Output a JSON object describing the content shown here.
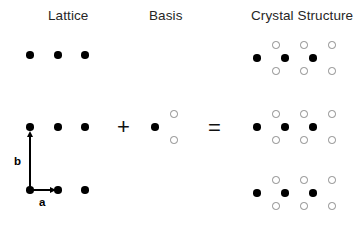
{
  "figure": {
    "width": 364,
    "height": 225,
    "background": "#ffffff",
    "equation": "Lattice + Basis = Crystal Structure"
  },
  "headings": [
    {
      "key": "lattice",
      "label": "Lattice",
      "x": 48,
      "y": 9
    },
    {
      "key": "basis",
      "label": "Basis",
      "x": 149,
      "y": 9
    },
    {
      "key": "crystal",
      "label": "Crystal Structure",
      "x": 251,
      "y": 9
    }
  ],
  "operators": [
    {
      "key": "plus",
      "symbol": "+",
      "x": 117,
      "y": 116
    },
    {
      "key": "equals",
      "symbol": "=",
      "x": 208,
      "y": 117
    }
  ],
  "colors": {
    "filled_atom": "#000000",
    "open_atom_fill": "#ffffff",
    "open_atom_stroke": "#8c8c8c",
    "text": "#262626",
    "vector": "#000000",
    "background": "#ffffff"
  },
  "atom_sizes": {
    "filled_diameter": 7.5,
    "open_diameter": 7.5
  },
  "lattice": {
    "name": "Lattice",
    "columns_x": [
      30,
      58,
      85
    ],
    "rows_y": [
      55,
      127,
      190
    ],
    "points": [
      {
        "x": 30,
        "y": 55
      },
      {
        "x": 58,
        "y": 55
      },
      {
        "x": 85,
        "y": 55
      },
      {
        "x": 30,
        "y": 127
      },
      {
        "x": 58,
        "y": 127
      },
      {
        "x": 85,
        "y": 127
      },
      {
        "x": 30,
        "y": 190
      },
      {
        "x": 58,
        "y": 190
      },
      {
        "x": 85,
        "y": 190
      }
    ],
    "vectors": [
      {
        "key": "b",
        "label": "b",
        "direction": "up",
        "origin": {
          "x": 30,
          "y": 189
        },
        "tip": {
          "x": 30,
          "y": 131
        },
        "label_pos": {
          "x": 14,
          "y": 155
        }
      },
      {
        "key": "a",
        "label": "a",
        "direction": "right",
        "origin": {
          "x": 32,
          "y": 190
        },
        "tip": {
          "x": 56,
          "y": 190
        },
        "label_pos": {
          "x": 39,
          "y": 196
        }
      }
    ]
  },
  "basis": {
    "name": "Basis",
    "atoms": [
      {
        "type": "filled",
        "x": 155,
        "y": 127
      },
      {
        "type": "open",
        "x": 174,
        "y": 114
      },
      {
        "type": "open",
        "x": 174,
        "y": 140
      }
    ]
  },
  "crystal": {
    "name": "Crystal Structure",
    "filled_columns_x": [
      257,
      285,
      313
    ],
    "open_columns_x": [
      276,
      304,
      332
    ],
    "group_centers_y": [
      58,
      127,
      193
    ],
    "open_offset_y": 13,
    "groups": [
      {
        "key": "group-top",
        "center_y": 58,
        "atoms": [
          {
            "type": "filled",
            "x": 257,
            "y": 58
          },
          {
            "type": "filled",
            "x": 285,
            "y": 58
          },
          {
            "type": "filled",
            "x": 313,
            "y": 58
          },
          {
            "type": "open",
            "x": 276,
            "y": 45
          },
          {
            "type": "open",
            "x": 304,
            "y": 45
          },
          {
            "type": "open",
            "x": 332,
            "y": 45
          },
          {
            "type": "open",
            "x": 276,
            "y": 71
          },
          {
            "type": "open",
            "x": 304,
            "y": 71
          },
          {
            "type": "open",
            "x": 332,
            "y": 71
          }
        ]
      },
      {
        "key": "group-middle",
        "center_y": 127,
        "atoms": [
          {
            "type": "filled",
            "x": 257,
            "y": 127
          },
          {
            "type": "filled",
            "x": 285,
            "y": 127
          },
          {
            "type": "filled",
            "x": 313,
            "y": 127
          },
          {
            "type": "open",
            "x": 276,
            "y": 114
          },
          {
            "type": "open",
            "x": 304,
            "y": 114
          },
          {
            "type": "open",
            "x": 332,
            "y": 114
          },
          {
            "type": "open",
            "x": 276,
            "y": 140
          },
          {
            "type": "open",
            "x": 304,
            "y": 140
          },
          {
            "type": "open",
            "x": 332,
            "y": 140
          }
        ]
      },
      {
        "key": "group-bottom",
        "center_y": 193,
        "atoms": [
          {
            "type": "filled",
            "x": 257,
            "y": 193
          },
          {
            "type": "filled",
            "x": 285,
            "y": 193
          },
          {
            "type": "filled",
            "x": 313,
            "y": 193
          },
          {
            "type": "open",
            "x": 276,
            "y": 180
          },
          {
            "type": "open",
            "x": 304,
            "y": 180
          },
          {
            "type": "open",
            "x": 332,
            "y": 180
          },
          {
            "type": "open",
            "x": 276,
            "y": 206
          },
          {
            "type": "open",
            "x": 304,
            "y": 206
          },
          {
            "type": "open",
            "x": 332,
            "y": 206
          }
        ]
      }
    ]
  }
}
